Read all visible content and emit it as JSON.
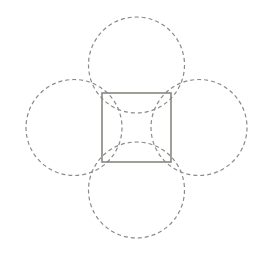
{
  "diagram": {
    "colors": {
      "background": "#ffffff",
      "square_stroke": "#8a8580",
      "circle_stroke": "#8a8a8a"
    },
    "square": {
      "x": 102,
      "y": 93,
      "width": 69,
      "height": 69
    },
    "circles": [
      {
        "id": "top",
        "cx": 136.5,
        "cy": 65,
        "r": 48
      },
      {
        "id": "right",
        "cx": 199,
        "cy": 127.5,
        "r": 48
      },
      {
        "id": "bottom",
        "cx": 136.5,
        "cy": 190,
        "r": 48
      },
      {
        "id": "left",
        "cx": 74,
        "cy": 127.5,
        "r": 48
      }
    ]
  }
}
